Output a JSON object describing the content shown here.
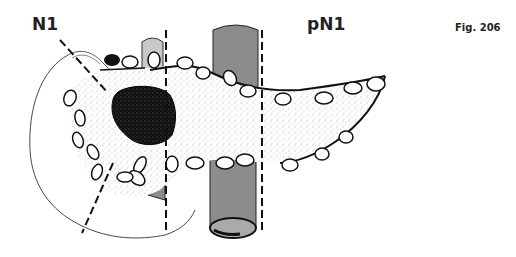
{
  "figure": {
    "label_left": "N1",
    "label_right": "pN1",
    "figure_number": "Fig. 206",
    "colors": {
      "outline": "#111111",
      "tumor": "#1a1a1a",
      "vessel": "#8c8c8c",
      "vessel_light": "#c8c8c8",
      "stipple": "#bdbdbd"
    }
  }
}
